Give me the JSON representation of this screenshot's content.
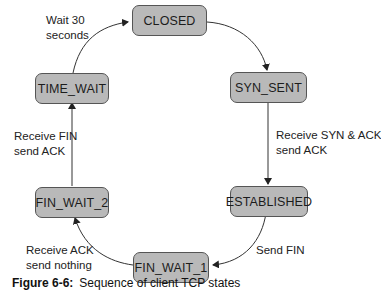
{
  "diagram": {
    "colors": {
      "node_fill": "#b9b9b9",
      "node_border": "#555555",
      "edge": "#333333"
    },
    "nodes": [
      {
        "id": "closed",
        "label": "CLOSED"
      },
      {
        "id": "syn_sent",
        "label": "SYN_SENT"
      },
      {
        "id": "established",
        "label": "ESTABLISHED"
      },
      {
        "id": "fin_wait_1",
        "label": "FIN_WAIT_1"
      },
      {
        "id": "fin_wait_2",
        "label": "FIN_WAIT_2"
      },
      {
        "id": "time_wait",
        "label": "TIME_WAIT"
      }
    ],
    "edges": [
      {
        "from": "closed",
        "to": "syn_sent",
        "label_line1": "",
        "label_line2": ""
      },
      {
        "from": "syn_sent",
        "to": "established",
        "label_line1": "Receive SYN & ACK",
        "label_line2": "send ACK"
      },
      {
        "from": "established",
        "to": "fin_wait_1",
        "label_line1": "Send FIN",
        "label_line2": ""
      },
      {
        "from": "fin_wait_1",
        "to": "fin_wait_2",
        "label_line1": "Receive ACK",
        "label_line2": "send nothing"
      },
      {
        "from": "fin_wait_2",
        "to": "time_wait",
        "label_line1": "Receive FIN",
        "label_line2": "send ACK"
      },
      {
        "from": "time_wait",
        "to": "closed",
        "label_line1": "Wait 30",
        "label_line2": "seconds"
      }
    ]
  },
  "caption": {
    "figure": "Figure 6-6:",
    "text": "Sequence of client TCP states"
  }
}
